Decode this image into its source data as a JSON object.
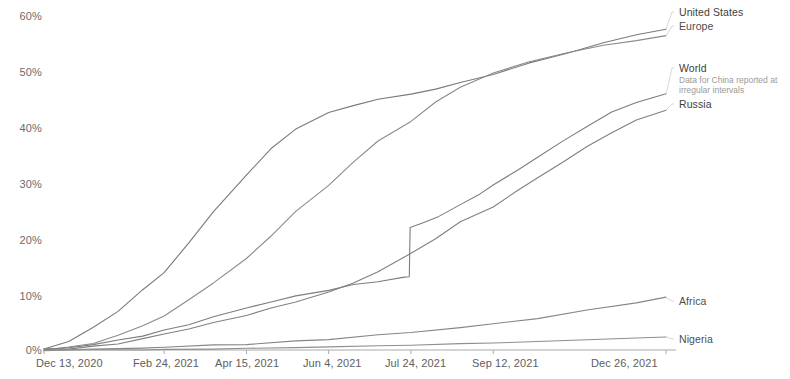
{
  "chart_data": {
    "type": "line",
    "title": "",
    "subtitle": "",
    "xlabel": "",
    "ylabel": "",
    "ylim": [
      0,
      65
    ],
    "xlim": [
      "Dec 13, 2020",
      "Dec 26, 2021"
    ],
    "grid": false,
    "legend_position": "right-inline-labels",
    "y_ticks": [
      "0%",
      "10%",
      "20%",
      "30%",
      "40%",
      "50%",
      "60%"
    ],
    "y_tick_values": [
      0,
      10,
      20,
      30,
      40,
      50,
      60
    ],
    "x_ticks": [
      "Dec 13, 2020",
      "Feb 24, 2021",
      "Apr 15, 2021",
      "Jun 4, 2021",
      "Jul 24, 2021",
      "Sep 12, 2021",
      "Dec 26, 2021"
    ],
    "x_tick_days": [
      0,
      73,
      123,
      173,
      223,
      273,
      378
    ],
    "annotations": [
      {
        "text": "Data for China reported at irregular intervals",
        "attached_to": "World"
      }
    ],
    "series": [
      {
        "name": "United States",
        "label": "United States",
        "color": "#7a7a7a",
        "end_value": 61.5,
        "x": [
          0,
          15,
          30,
          45,
          60,
          73,
          88,
          103,
          123,
          138,
          153,
          173,
          188,
          203,
          223,
          238,
          253,
          273,
          295,
          318,
          340,
          360,
          378
        ],
        "values": [
          0.2,
          1.6,
          4.2,
          7.5,
          11.5,
          15.0,
          20.5,
          26.5,
          33.5,
          38.5,
          42.5,
          45.5,
          47.0,
          48.0,
          49.0,
          50.0,
          51.2,
          53.0,
          55.0,
          57.0,
          58.8,
          60.4,
          61.5
        ]
      },
      {
        "name": "Europe",
        "label": "Europe",
        "color": "#8a8a8a",
        "end_value": 60.2,
        "x": [
          0,
          15,
          30,
          45,
          60,
          73,
          88,
          103,
          123,
          138,
          153,
          173,
          188,
          203,
          223,
          238,
          253,
          273,
          295,
          318,
          340,
          360,
          378
        ],
        "values": [
          0.1,
          0.5,
          1.4,
          2.8,
          4.6,
          6.5,
          9.5,
          13.0,
          17.5,
          22.0,
          26.5,
          31.5,
          36.0,
          40.0,
          44.0,
          47.5,
          50.5,
          53.0,
          55.2,
          57.0,
          58.4,
          59.5,
          60.2
        ]
      },
      {
        "name": "World",
        "label": "World",
        "color": "#7d7d7d",
        "end_value": 49.0,
        "note": "Sharp step near Jul 24, 2021 due to China data reported at irregular intervals",
        "x": [
          0,
          15,
          30,
          45,
          60,
          73,
          88,
          103,
          123,
          138,
          153,
          173,
          188,
          203,
          218,
          222,
          222.5,
          230,
          240,
          253,
          265,
          273,
          288,
          300,
          315,
          330,
          345,
          360,
          378
        ],
        "values": [
          0.1,
          0.4,
          1.0,
          1.8,
          2.8,
          3.8,
          5.0,
          6.3,
          8.0,
          9.2,
          10.3,
          11.6,
          12.5,
          13.2,
          13.8,
          14.0,
          23.5,
          24.3,
          25.8,
          27.8,
          30.0,
          31.5,
          34.5,
          37.0,
          40.0,
          43.0,
          45.5,
          47.5,
          49.0
        ]
      },
      {
        "name": "Russia",
        "label": "Russia",
        "color": "#808080",
        "end_value": 46.0,
        "x": [
          0,
          15,
          30,
          45,
          60,
          73,
          88,
          103,
          123,
          138,
          153,
          173,
          188,
          203,
          223,
          238,
          253,
          273,
          288,
          300,
          315,
          330,
          345,
          360,
          378
        ],
        "values": [
          0.1,
          0.3,
          0.7,
          1.3,
          2.1,
          3.0,
          4.0,
          5.2,
          6.8,
          8.0,
          9.3,
          11.0,
          12.8,
          15.0,
          18.5,
          21.5,
          24.5,
          27.5,
          30.5,
          33.0,
          36.0,
          39.0,
          41.8,
          44.0,
          46.0
        ]
      },
      {
        "name": "Africa",
        "label": "Africa",
        "color": "#868686",
        "end_value": 10.0,
        "x": [
          0,
          30,
          60,
          73,
          103,
          123,
          153,
          173,
          203,
          223,
          253,
          273,
          300,
          330,
          360,
          378
        ],
        "values": [
          0.0,
          0.1,
          0.3,
          0.5,
          0.9,
          1.2,
          1.7,
          2.1,
          2.8,
          3.3,
          4.3,
          5.0,
          6.2,
          7.6,
          9.1,
          10.0
        ]
      },
      {
        "name": "Nigeria",
        "label": "Nigeria",
        "color": "#8e8e8e",
        "end_value": 2.5,
        "x": [
          0,
          30,
          60,
          73,
          103,
          123,
          153,
          173,
          203,
          223,
          253,
          273,
          300,
          330,
          360,
          378
        ],
        "values": [
          0.0,
          0.02,
          0.05,
          0.1,
          0.2,
          0.3,
          0.45,
          0.6,
          0.8,
          0.95,
          1.2,
          1.35,
          1.6,
          1.95,
          2.3,
          2.5
        ]
      }
    ]
  },
  "axis": {
    "line_color": "#a9a9a9"
  },
  "labels": {
    "united_states": "United States",
    "europe": "Europe",
    "world": "World",
    "world_note_line1": "Data for China reported at",
    "world_note_line2": "irregular intervals",
    "russia": "Russia",
    "africa": "Africa",
    "nigeria": "Nigeria"
  },
  "y_axis": {
    "t0": "0%",
    "t10": "10%",
    "t20": "20%",
    "t30": "30%",
    "t40": "40%",
    "t50": "50%",
    "t60": "60%"
  },
  "x_axis": {
    "t0": "Dec 13, 2020",
    "t1": "Feb 24, 2021",
    "t2": "Apr 15, 2021",
    "t3": "Jun 4, 2021",
    "t4": "Jul 24, 2021",
    "t5": "Sep 12, 2021",
    "t6": "Dec 26, 2021"
  }
}
